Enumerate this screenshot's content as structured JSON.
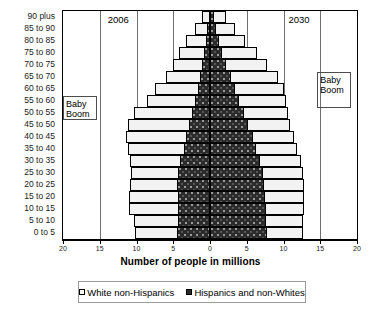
{
  "chart_data": {
    "type": "bar",
    "subtype": "population-pyramid",
    "title": "",
    "xlabel": "Number of people in millions",
    "ylabel": "",
    "xlim": [
      -20,
      20
    ],
    "xticks": [
      20,
      15,
      10,
      5,
      0,
      5,
      10,
      15,
      20
    ],
    "grid": true,
    "legend_position": "bottom",
    "left_panel_label": "2006",
    "right_panel_label": "2030",
    "annotations": [
      "Baby Boom",
      "Baby Boom"
    ],
    "categories": [
      "90 plus",
      "85 to 90",
      "80 to 85",
      "75 to 80",
      "70 to 75",
      "65 to 70",
      "60 to 65",
      "55 to 60",
      "50 to 55",
      "45 to 50",
      "40 to 45",
      "35 to 40",
      "30 to 35",
      "25 to 30",
      "20 to 25",
      "15 to 20",
      "10 to 15",
      "5 to 10",
      "0 to 5"
    ],
    "series": [
      {
        "name": "White non-Hispanics",
        "side": "left",
        "panel": "2006",
        "values": [
          0.9,
          1.6,
          2.6,
          3.4,
          4.0,
          4.6,
          5.8,
          6.6,
          8.0,
          8.4,
          8.2,
          7.6,
          6.8,
          6.3,
          6.4,
          6.6,
          6.6,
          6.1,
          5.7
        ]
      },
      {
        "name": "Hispanics and non-Whites",
        "side": "left",
        "panel": "2006",
        "values": [
          0.2,
          0.4,
          0.6,
          0.8,
          1.1,
          1.4,
          1.7,
          2.0,
          2.4,
          2.8,
          3.2,
          3.6,
          4.1,
          4.4,
          4.5,
          4.4,
          4.4,
          4.3,
          4.5
        ]
      },
      {
        "name": "White non-Hispanics",
        "side": "right",
        "panel": "2030",
        "values": [
          1.7,
          2.6,
          3.6,
          4.7,
          5.6,
          6.4,
          6.6,
          6.4,
          6.0,
          5.7,
          5.6,
          5.6,
          5.6,
          5.5,
          5.4,
          5.3,
          5.2,
          5.1,
          5.0
        ]
      },
      {
        "name": "Hispanics and non-Whites",
        "side": "right",
        "panel": "2030",
        "values": [
          0.5,
          0.8,
          1.2,
          1.7,
          2.2,
          2.8,
          3.4,
          4.0,
          4.6,
          5.2,
          5.8,
          6.3,
          6.8,
          7.2,
          7.4,
          7.5,
          7.6,
          7.6,
          7.7
        ]
      }
    ]
  },
  "legend": {
    "items": [
      {
        "label": "White non-Hispanics",
        "swatch": "white"
      },
      {
        "label": "Hispanics and non-Whites",
        "swatch": "dark"
      }
    ]
  },
  "axis": {
    "x_title": "Number of people in millions"
  },
  "labels": {
    "year_left": "2006",
    "year_right": "2030",
    "boom_left": "Baby\nBoom",
    "boom_right": "Baby\nBoom"
  }
}
